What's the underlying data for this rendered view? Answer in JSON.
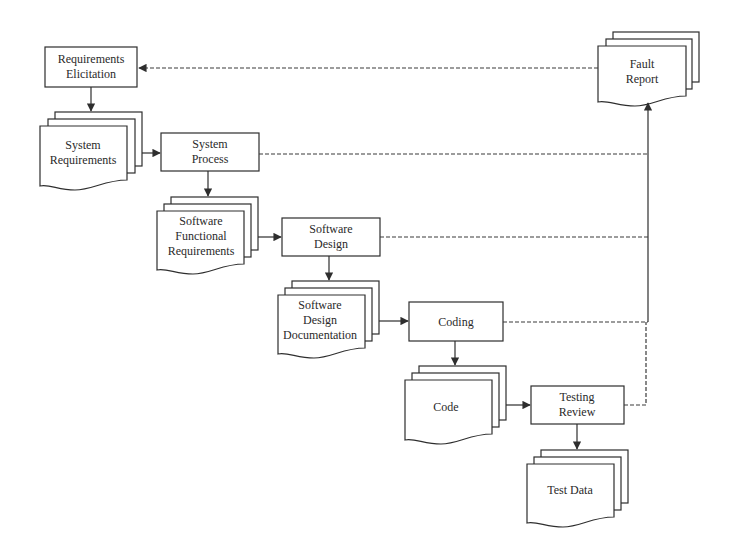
{
  "diagram": {
    "title": "",
    "processes": [
      {
        "id": "req_elicitation",
        "line1": "Requirements",
        "line2": "Elicitation"
      },
      {
        "id": "system_process",
        "line1": "System",
        "line2": "Process"
      },
      {
        "id": "software_design",
        "line1": "Software",
        "line2": "Design"
      },
      {
        "id": "coding",
        "line1": "Coding",
        "line2": ""
      },
      {
        "id": "testing_review",
        "line1": "Testing",
        "line2": "Review"
      }
    ],
    "documents": [
      {
        "id": "system_requirements",
        "line1": "System",
        "line2": "Requirements",
        "line3": ""
      },
      {
        "id": "sw_functional_requirements",
        "line1": "Software",
        "line2": "Functional",
        "line3": "Requirements"
      },
      {
        "id": "sw_design_documentation",
        "line1": "Software",
        "line2": "Design",
        "line3": "Documentation"
      },
      {
        "id": "code",
        "line1": "Code",
        "line2": "",
        "line3": ""
      },
      {
        "id": "test_data",
        "line1": "Test Data",
        "line2": "",
        "line3": ""
      },
      {
        "id": "fault_report",
        "line1": "Fault",
        "line2": "Report",
        "line3": ""
      }
    ],
    "flows": [
      {
        "from": "Requirements Elicitation",
        "to": "System Requirements",
        "style": "solid"
      },
      {
        "from": "System Requirements",
        "to": "System Process",
        "style": "solid"
      },
      {
        "from": "System Process",
        "to": "Software Functional Requirements",
        "style": "solid"
      },
      {
        "from": "Software Functional Requirements",
        "to": "Software Design",
        "style": "solid"
      },
      {
        "from": "Software Design",
        "to": "Software Design Documentation",
        "style": "solid"
      },
      {
        "from": "Software Design Documentation",
        "to": "Coding",
        "style": "solid"
      },
      {
        "from": "Coding",
        "to": "Code",
        "style": "solid"
      },
      {
        "from": "Code",
        "to": "Testing Review",
        "style": "solid"
      },
      {
        "from": "Testing Review",
        "to": "Test Data",
        "style": "solid"
      },
      {
        "from": "System Process",
        "to": "Fault Report",
        "style": "dashed"
      },
      {
        "from": "Software Design",
        "to": "Fault Report",
        "style": "dashed"
      },
      {
        "from": "Coding",
        "to": "Fault Report",
        "style": "dashed"
      },
      {
        "from": "Testing Review",
        "to": "Fault Report",
        "style": "dashed"
      },
      {
        "from": "Fault Report",
        "to": "Requirements Elicitation",
        "style": "dashed"
      }
    ],
    "colors": {
      "stroke": "#2e2e2e",
      "text": "#2a2a2a",
      "background": "#ffffff"
    }
  }
}
